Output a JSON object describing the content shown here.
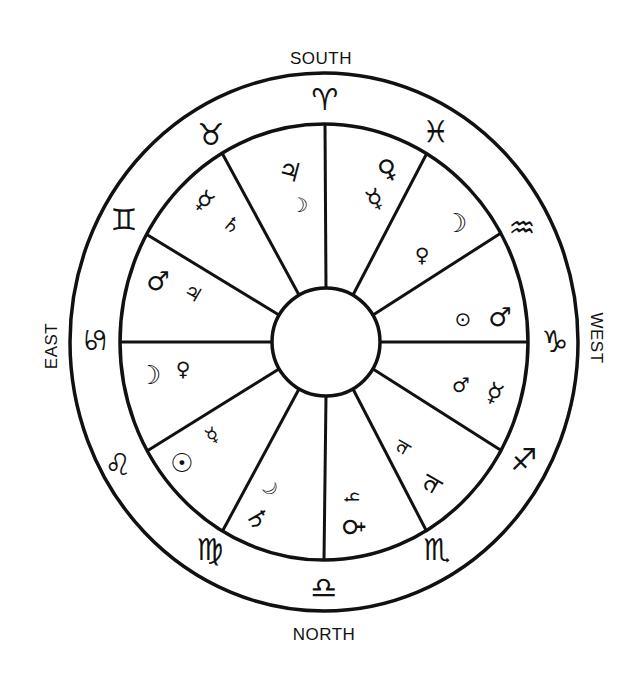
{
  "colors": {
    "ink": "#111111",
    "paper": "#ffffff"
  },
  "directions": {
    "south": "SOUTH",
    "north": "NORTH",
    "east": "EAST",
    "west": "WEST"
  },
  "signs": [
    {
      "name": "aries",
      "glyph": "♈"
    },
    {
      "name": "taurus",
      "glyph": "♉"
    },
    {
      "name": "gemini",
      "glyph": "♊"
    },
    {
      "name": "cancer",
      "glyph": "♋"
    },
    {
      "name": "leo",
      "glyph": "♌"
    },
    {
      "name": "virgo",
      "glyph": "♍"
    },
    {
      "name": "libra",
      "glyph": "♎"
    },
    {
      "name": "scorpio",
      "glyph": "♏"
    },
    {
      "name": "sagittarius",
      "glyph": "♐"
    },
    {
      "name": "capricorn",
      "glyph": "♑"
    },
    {
      "name": "aquarius",
      "glyph": "♒"
    },
    {
      "name": "pisces",
      "glyph": "♓"
    }
  ],
  "houses": [
    {
      "position": "top-left",
      "planets": [
        {
          "name": "jupiter",
          "glyph": "♃"
        },
        {
          "name": "moon",
          "glyph": "☽"
        }
      ]
    },
    {
      "position": "top-right",
      "planets": [
        {
          "name": "venus",
          "glyph": "♀"
        },
        {
          "name": "mercury",
          "glyph": "☿"
        }
      ]
    },
    {
      "position": "upper-right",
      "planets": [
        {
          "name": "moon",
          "glyph": "☽"
        },
        {
          "name": "venus",
          "glyph": "♀"
        }
      ]
    },
    {
      "position": "right-upper",
      "planets": [
        {
          "name": "sun",
          "glyph": "⊙"
        },
        {
          "name": "mars",
          "glyph": "♂"
        }
      ]
    },
    {
      "position": "right-lower",
      "planets": [
        {
          "name": "mars",
          "glyph": "♂"
        },
        {
          "name": "mercury",
          "glyph": "☿"
        }
      ]
    },
    {
      "position": "lower-right",
      "planets": [
        {
          "name": "jupiter",
          "glyph": "♃"
        },
        {
          "name": "jupiter",
          "glyph": "♃"
        }
      ]
    },
    {
      "position": "bottom-right",
      "planets": [
        {
          "name": "saturn",
          "glyph": "♄"
        },
        {
          "name": "venus",
          "glyph": "♀"
        }
      ]
    },
    {
      "position": "bottom-left",
      "planets": [
        {
          "name": "moon",
          "glyph": "☽"
        },
        {
          "name": "saturn",
          "glyph": "♄"
        }
      ]
    },
    {
      "position": "lower-left",
      "planets": [
        {
          "name": "sun",
          "glyph": "☉"
        },
        {
          "name": "mercury",
          "glyph": "☿"
        }
      ]
    },
    {
      "position": "left-lower",
      "planets": [
        {
          "name": "moon",
          "glyph": "☽"
        },
        {
          "name": "venus",
          "glyph": "♀"
        }
      ]
    },
    {
      "position": "left-upper",
      "planets": [
        {
          "name": "mars",
          "glyph": "♂"
        },
        {
          "name": "jupiter",
          "glyph": "♃"
        }
      ]
    },
    {
      "position": "upper-left",
      "planets": [
        {
          "name": "mercury",
          "glyph": "☿"
        },
        {
          "name": "saturn",
          "glyph": "♄"
        }
      ]
    }
  ]
}
